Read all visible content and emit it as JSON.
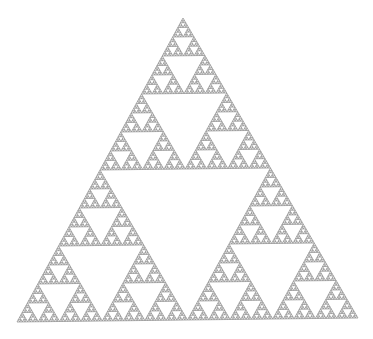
{
  "figure": {
    "background_color": "#ffffff",
    "stroke_color": "#8a8a8a",
    "depth": 7,
    "vertices": {
      "apex": [
        183,
        18
      ],
      "bottom_left": [
        17,
        322
      ],
      "bottom_right": [
        358,
        318
      ]
    }
  }
}
